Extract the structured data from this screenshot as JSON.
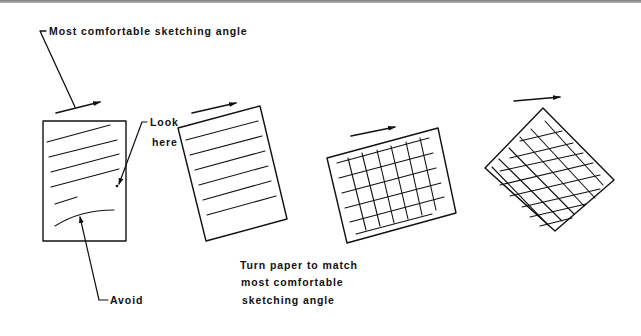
{
  "figure": {
    "type": "instructional-sketching-diagram",
    "ink_color": "#111111",
    "background": "#ffffff"
  },
  "labels": {
    "top_callout": "Most comfortable sketching angle",
    "look_line1": "Look",
    "look_line2": "here",
    "avoid": "Avoid",
    "caption_line1": "Turn paper to match",
    "caption_line2": "most comfortable",
    "caption_line3": "sketching angle"
  },
  "panels": [
    {
      "id": "paper-1",
      "description": "Upright paper with slanted sketch lines; Look here and Avoid callouts",
      "content": "lines"
    },
    {
      "id": "paper-2",
      "description": "Paper rotated slightly to align lines with sketching angle",
      "content": "lines"
    },
    {
      "id": "paper-3",
      "description": "Rotated paper with grid",
      "content": "grid"
    },
    {
      "id": "paper-4",
      "description": "Paper rotated ~45° with diagonal grid",
      "content": "grid"
    }
  ],
  "icons": {
    "direction-arrow": "→"
  }
}
